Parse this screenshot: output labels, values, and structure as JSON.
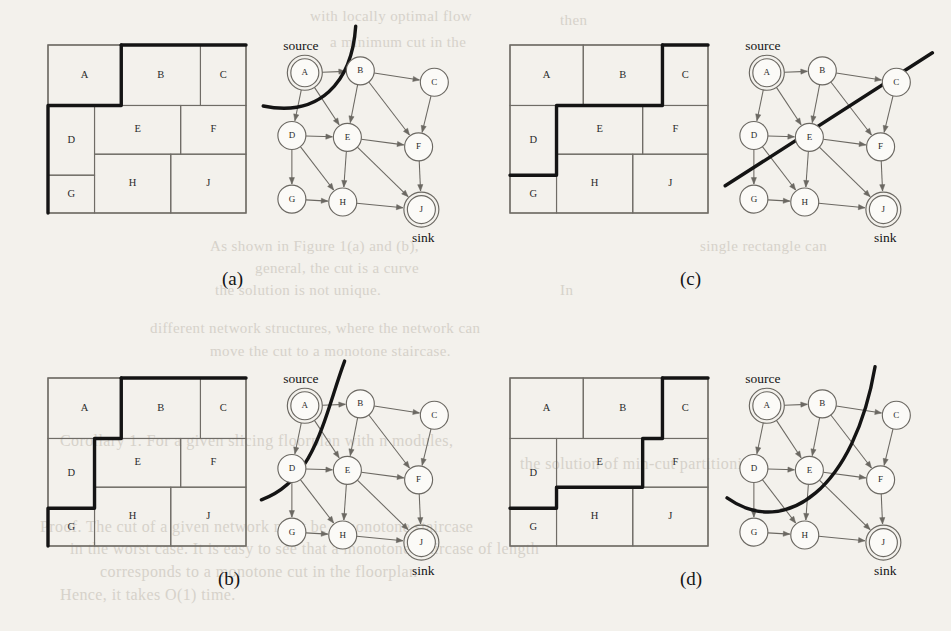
{
  "figure": {
    "panels": [
      {
        "id": "a",
        "caption": "(a)",
        "cut_style": "curve-concave-right",
        "source_label": "source",
        "sink_label": "sink"
      },
      {
        "id": "b",
        "caption": "(b)",
        "cut_style": "curve-bulge-left",
        "source_label": "source",
        "sink_label": "sink"
      },
      {
        "id": "c",
        "caption": "(c)",
        "cut_style": "straight-diagonal",
        "source_label": "source",
        "sink_label": "sink"
      },
      {
        "id": "d",
        "caption": "(d)",
        "cut_style": "curve-u-shape",
        "source_label": "source",
        "sink_label": "sink"
      }
    ],
    "floorplan": {
      "cells": [
        {
          "id": "A",
          "label": "A",
          "x": 0,
          "y": 0,
          "w": 0.37,
          "h": 0.36
        },
        {
          "id": "B",
          "label": "B",
          "x": 0.37,
          "y": 0,
          "w": 0.4,
          "h": 0.36
        },
        {
          "id": "C",
          "label": "C",
          "x": 0.77,
          "y": 0,
          "w": 0.23,
          "h": 0.36
        },
        {
          "id": "D",
          "label": "D",
          "x": 0,
          "y": 0.36,
          "w": 0.235,
          "h": 0.415
        },
        {
          "id": "E",
          "label": "E",
          "x": 0.235,
          "y": 0.36,
          "w": 0.435,
          "h": 0.29
        },
        {
          "id": "F",
          "label": "F",
          "x": 0.67,
          "y": 0.36,
          "w": 0.33,
          "h": 0.29
        },
        {
          "id": "G",
          "label": "G",
          "x": 0,
          "y": 0.775,
          "w": 0.235,
          "h": 0.225
        },
        {
          "id": "H",
          "label": "H",
          "x": 0.235,
          "y": 0.65,
          "w": 0.385,
          "h": 0.35
        },
        {
          "id": "J",
          "label": "J",
          "x": 0.62,
          "y": 0.65,
          "w": 0.38,
          "h": 0.35
        }
      ]
    },
    "graph": {
      "nodes": [
        {
          "id": "A",
          "label": "A",
          "x": 0.145,
          "y": 0.125,
          "ring": true,
          "terminal": "source"
        },
        {
          "id": "B",
          "label": "B",
          "x": 0.445,
          "y": 0.115,
          "ring": false,
          "terminal": null
        },
        {
          "id": "C",
          "label": "C",
          "x": 0.845,
          "y": 0.175,
          "ring": false,
          "terminal": null
        },
        {
          "id": "D",
          "label": "D",
          "x": 0.075,
          "y": 0.455,
          "ring": false,
          "terminal": null
        },
        {
          "id": "E",
          "label": "E",
          "x": 0.375,
          "y": 0.465,
          "ring": false,
          "terminal": null
        },
        {
          "id": "F",
          "label": "F",
          "x": 0.76,
          "y": 0.515,
          "ring": false,
          "terminal": null
        },
        {
          "id": "G",
          "label": "G",
          "x": 0.075,
          "y": 0.79,
          "ring": false,
          "terminal": null
        },
        {
          "id": "H",
          "label": "H",
          "x": 0.35,
          "y": 0.805,
          "ring": false,
          "terminal": null
        },
        {
          "id": "J",
          "label": "J",
          "x": 0.775,
          "y": 0.845,
          "ring": true,
          "terminal": "sink"
        }
      ],
      "edges": [
        {
          "from": "A",
          "to": "B"
        },
        {
          "from": "A",
          "to": "D"
        },
        {
          "from": "A",
          "to": "E"
        },
        {
          "from": "B",
          "to": "C"
        },
        {
          "from": "B",
          "to": "E"
        },
        {
          "from": "B",
          "to": "F"
        },
        {
          "from": "C",
          "to": "F"
        },
        {
          "from": "D",
          "to": "E"
        },
        {
          "from": "D",
          "to": "G"
        },
        {
          "from": "D",
          "to": "H"
        },
        {
          "from": "E",
          "to": "F"
        },
        {
          "from": "E",
          "to": "H"
        },
        {
          "from": "E",
          "to": "J"
        },
        {
          "from": "F",
          "to": "J"
        },
        {
          "from": "G",
          "to": "H"
        },
        {
          "from": "H",
          "to": "J"
        }
      ]
    },
    "colors": {
      "page_background": "#f3f1ec",
      "ink": "#141414",
      "line": "#6b6862",
      "bleed_text": "#cdc8bf"
    }
  },
  "background_text": {
    "lines": [
      {
        "text": "with locally optimal flow",
        "x": 310,
        "y": 8,
        "size": 15
      },
      {
        "text": "then",
        "x": 560,
        "y": 12,
        "size": 15
      },
      {
        "text": "a minimum cut in the",
        "x": 330,
        "y": 34,
        "size": 15
      },
      {
        "text": "As shown in Figure 1(a) and (b),",
        "x": 210,
        "y": 238,
        "size": 15
      },
      {
        "text": "single rectangle can",
        "x": 700,
        "y": 238,
        "size": 15
      },
      {
        "text": "general, the cut is a curve",
        "x": 255,
        "y": 260,
        "size": 15
      },
      {
        "text": "the solution is not unique.",
        "x": 215,
        "y": 282,
        "size": 15
      },
      {
        "text": "In",
        "x": 560,
        "y": 282,
        "size": 15
      },
      {
        "text": "different network structures, where the network can",
        "x": 150,
        "y": 320,
        "size": 15
      },
      {
        "text": "move the cut to a monotone staircase.",
        "x": 210,
        "y": 343,
        "size": 15
      },
      {
        "text": "Corollary 1. For a given slicing floorplan with n modules,",
        "x": 60,
        "y": 432,
        "size": 16
      },
      {
        "text": "the solution of min-cut partitioning",
        "x": 520,
        "y": 455,
        "size": 16
      },
      {
        "text": "Proof. The cut of a given network must be a monotone staircase",
        "x": 40,
        "y": 518,
        "size": 16
      },
      {
        "text": "in the worst case. It is easy to see that a monotone staircase of length",
        "x": 70,
        "y": 540,
        "size": 16
      },
      {
        "text": "corresponds to a monotone cut in the floorplan",
        "x": 100,
        "y": 563,
        "size": 16
      },
      {
        "text": "Hence, it takes O(1) time.",
        "x": 60,
        "y": 586,
        "size": 16
      }
    ]
  }
}
